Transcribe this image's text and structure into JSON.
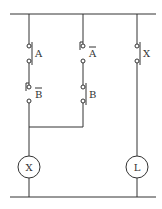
{
  "diagram": {
    "type": "ladder-logic-circuit",
    "contacts": [
      {
        "id": "A",
        "label": "A",
        "kind": "normally-open",
        "rung": 1,
        "position": "top"
      },
      {
        "id": "B_bar",
        "label": "B",
        "negated": true,
        "kind": "normally-closed",
        "rung": 1,
        "position": "bottom"
      },
      {
        "id": "A_bar",
        "label": "A",
        "negated": true,
        "kind": "normally-closed",
        "rung": 2,
        "position": "top"
      },
      {
        "id": "B",
        "label": "B",
        "kind": "normally-open",
        "rung": 2,
        "position": "bottom"
      },
      {
        "id": "X_contact",
        "label": "X",
        "kind": "normally-open",
        "rung": 3,
        "position": "top"
      }
    ],
    "coils": [
      {
        "id": "X_coil",
        "label": "X"
      },
      {
        "id": "L_coil",
        "label": "L"
      }
    ],
    "colors": {
      "line": "#333333",
      "background": "#ffffff"
    }
  }
}
